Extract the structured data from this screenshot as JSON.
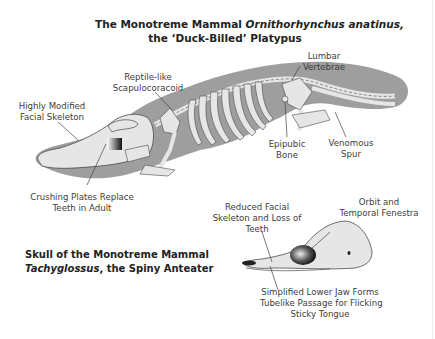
{
  "platypus": {
    "title_line1_prefix": "The Monotreme Mammal ",
    "title_line1_italic": "Ornithorhynchus anatinus,",
    "title_line2": "the ‘Duck-Billed’ Platypus",
    "labels": {
      "lumbar": [
        "Lumbar",
        "Vertebrae"
      ],
      "scapulocoracoid": [
        "Reptile-like",
        "Scapulocoracoid"
      ],
      "facial": [
        "Highly Modified",
        "Facial Skeleton"
      ],
      "crushing": [
        "Crushing Plates Replace",
        "Teeth in Adult"
      ],
      "epipubic": [
        "Epipubic",
        "Bone"
      ],
      "spur": [
        "Venomous",
        "Spur"
      ]
    }
  },
  "anteater": {
    "title_line1": "Skull of the Monotreme Mammal",
    "title_line2_italic": "Tachyglossus",
    "title_line2_rest": ", the Spiny Anteater",
    "labels": {
      "reduced": [
        "Reduced Facial",
        "Skeleton and Loss of",
        "Teeth"
      ],
      "orbit": [
        "Orbit and",
        "Temporal Fenestra"
      ],
      "jaw": [
        "Simplified Lower Jaw Forms",
        "Tubelike Passage for Flicking",
        "Sticky Tongue"
      ]
    }
  },
  "colors": {
    "silhouette": "#9e9e9e",
    "bone": "#e6e6e6",
    "bone_outline": "#4a4a4a",
    "text": "#3d3d3d",
    "title": "#222222"
  }
}
